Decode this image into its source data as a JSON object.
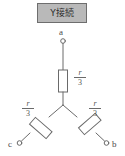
{
  "diagram": {
    "title": "Y接続",
    "title_box_fill": "#b9b9b9",
    "title_box_border": "#6e6e6e",
    "line_color": "#6a6a6a",
    "background": "#ffffff",
    "terminals": [
      {
        "id": "a",
        "label": "a",
        "position": "top"
      },
      {
        "id": "b",
        "label": "b",
        "position": "bottom-right"
      },
      {
        "id": "c",
        "label": "c",
        "position": "bottom-left"
      }
    ],
    "resistors": [
      {
        "id": "top",
        "numerator": "r",
        "denominator": "3",
        "orientation": "vertical"
      },
      {
        "id": "left",
        "numerator": "r",
        "denominator": "3",
        "orientation": "diagonal-down-left"
      },
      {
        "id": "right",
        "numerator": "r",
        "denominator": "3",
        "orientation": "diagonal-down-right"
      }
    ]
  }
}
